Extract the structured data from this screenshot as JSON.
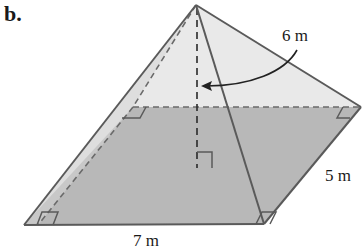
{
  "figure": {
    "part_label": "b.",
    "shape": "rectangular pyramid",
    "labels": {
      "height": "6 m",
      "width": "5 m",
      "length": "7 m"
    },
    "colors": {
      "base_fill": "#b8b8b8",
      "face_fill": "#e9e9e9",
      "edge": "#5a5a5a",
      "hidden_edge": "#6a6a6a",
      "text": "#1a1a1a"
    },
    "vertices": {
      "apex": [
        196,
        5
      ],
      "front_left": [
        24,
        225
      ],
      "front_right": [
        264,
        224
      ],
      "back_right": [
        361,
        107
      ],
      "back_left": [
        133,
        107
      ],
      "height_foot": [
        197,
        168
      ]
    }
  }
}
